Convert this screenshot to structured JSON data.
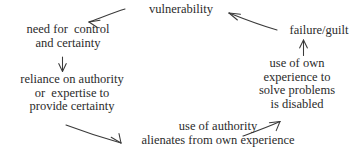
{
  "diagram": {
    "background_color": "#ffffff",
    "text_color": "#2b2b2b",
    "arrow_color": "#3a3a3a",
    "nodes": {
      "vulnerability": {
        "lines": [
          "vulnerability"
        ]
      },
      "failure_guilt": {
        "lines": [
          "failure/guilt"
        ]
      },
      "need_control": {
        "lines": [
          "need for  control",
          "and certainty"
        ]
      },
      "reliance_authority": {
        "lines": [
          "reliance on authority",
          "or  expertise to",
          "provide certainty"
        ]
      },
      "use_own_experience": {
        "lines": [
          "use of own",
          "experience to",
          "solve problems",
          "is disabled"
        ]
      },
      "use_authority": {
        "lines": [
          "use of authority",
          "alienates from own experience"
        ]
      }
    },
    "arrows": [
      {
        "name": "vulnerability-to-need-control",
        "from": "vulnerability",
        "to": "need_control",
        "direction": "left-down"
      },
      {
        "name": "failure-guilt-to-vulnerability",
        "from": "failure_guilt",
        "to": "vulnerability",
        "direction": "up-left"
      },
      {
        "name": "need-control-to-reliance",
        "from": "need_control",
        "to": "reliance_authority",
        "direction": "down"
      },
      {
        "name": "reliance-to-use-authority",
        "from": "reliance_authority",
        "to": "use_authority",
        "direction": "down-right"
      },
      {
        "name": "use-authority-to-use-own-experience",
        "from": "use_authority",
        "to": "use_own_experience",
        "direction": "up-right"
      },
      {
        "name": "use-own-experience-to-failure-guilt",
        "from": "use_own_experience",
        "to": "failure_guilt",
        "direction": "up"
      }
    ]
  }
}
